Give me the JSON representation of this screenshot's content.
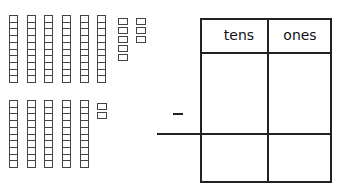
{
  "worksheet": {
    "operation": "subtraction",
    "operator_symbol": "−",
    "minuend": {
      "tens": 6,
      "ones": 8,
      "value": 68
    },
    "subtrahend": {
      "tens": 5,
      "ones": 2,
      "value": 52
    },
    "table": {
      "headers": [
        "tens",
        "ones"
      ],
      "rows": [
        [
          "",
          ""
        ],
        [
          "",
          ""
        ]
      ]
    }
  }
}
